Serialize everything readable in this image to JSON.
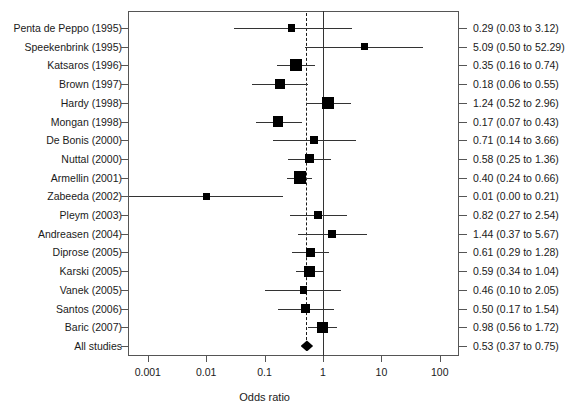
{
  "chart_data": {
    "type": "forest",
    "title": "",
    "xlabel": "Odds ratio",
    "ylabel": "",
    "xscale": "log",
    "xlim": [
      0.001,
      100
    ],
    "xticks": [
      0.001,
      0.01,
      0.1,
      1,
      10,
      100
    ],
    "xticklabels": [
      "0.001",
      "0.01",
      "0.1",
      "1",
      "10",
      "100"
    ],
    "null_line": 1,
    "pooled_line": 0.53,
    "grid": false,
    "legend": "none",
    "columns": [
      "Study",
      "Odds ratio (95% CI)"
    ],
    "rows": [
      {
        "study": "Penta de Peppo (1995)",
        "or": 0.29,
        "low": 0.03,
        "high": 3.12,
        "result": "0.29 (0.03 to 3.12)",
        "weight": 0.3,
        "marker": "square"
      },
      {
        "study": "Speekenbrink (1995)",
        "or": 5.09,
        "low": 0.5,
        "high": 52.29,
        "result": "5.09 (0.50 to 52.29)",
        "weight": 0.28,
        "marker": "square"
      },
      {
        "study": "Katsaros (1996)",
        "or": 0.35,
        "low": 0.16,
        "high": 0.74,
        "result": "0.35 (0.16 to 0.74)",
        "weight": 0.8,
        "marker": "square"
      },
      {
        "study": "Brown (1997)",
        "or": 0.18,
        "low": 0.06,
        "high": 0.55,
        "result": "0.18 (0.06 to 0.55)",
        "weight": 0.58,
        "marker": "square"
      },
      {
        "study": "Hardy (1998)",
        "or": 1.24,
        "low": 0.52,
        "high": 2.96,
        "result": "1.24 (0.52 to 2.96)",
        "weight": 0.8,
        "marker": "square"
      },
      {
        "study": "Mongan (1998)",
        "or": 0.17,
        "low": 0.07,
        "high": 0.43,
        "result": "0.17 (0.07 to 0.43)",
        "weight": 0.62,
        "marker": "square"
      },
      {
        "study": "De Bonis (2000)",
        "or": 0.71,
        "low": 0.14,
        "high": 3.66,
        "result": "0.71 (0.14 to 3.66)",
        "weight": 0.34,
        "marker": "square"
      },
      {
        "study": "Nuttal (2000)",
        "or": 0.58,
        "low": 0.25,
        "high": 1.36,
        "result": "0.58 (0.25 to 1.36)",
        "weight": 0.48,
        "marker": "square"
      },
      {
        "study": "Armellin (2001)",
        "or": 0.4,
        "low": 0.24,
        "high": 0.66,
        "result": "0.40 (0.24 to 0.66)",
        "weight": 0.82,
        "marker": "square"
      },
      {
        "study": "Zabeeda (2002)",
        "or": 0.01,
        "low": 0.0,
        "high": 0.21,
        "result": "0.01 (0.00 to 0.21)",
        "weight": 0.26,
        "marker": "square"
      },
      {
        "study": "Pleym (2003)",
        "or": 0.82,
        "low": 0.27,
        "high": 2.54,
        "result": "0.82 (0.27 to 2.54)",
        "weight": 0.4,
        "marker": "square"
      },
      {
        "study": "Andreasen (2004)",
        "or": 1.44,
        "low": 0.37,
        "high": 5.67,
        "result": "1.44 (0.37 to 5.67)",
        "weight": 0.38,
        "marker": "square"
      },
      {
        "study": "Diprose (2005)",
        "or": 0.61,
        "low": 0.29,
        "high": 1.28,
        "result": "0.61 (0.29 to 1.28)",
        "weight": 0.54,
        "marker": "square"
      },
      {
        "study": "Karski (2005)",
        "or": 0.59,
        "low": 0.34,
        "high": 1.04,
        "result": "0.59 (0.34 to 1.04)",
        "weight": 0.68,
        "marker": "square"
      },
      {
        "study": "Vanek (2005)",
        "or": 0.46,
        "low": 0.1,
        "high": 2.05,
        "result": "0.46 (0.10 to 2.05)",
        "weight": 0.32,
        "marker": "square"
      },
      {
        "study": "Santos (2006)",
        "or": 0.5,
        "low": 0.17,
        "high": 1.54,
        "result": "0.50 (0.17 to 1.54)",
        "weight": 0.4,
        "marker": "square"
      },
      {
        "study": "Baric (2007)",
        "or": 0.98,
        "low": 0.56,
        "high": 1.72,
        "result": "0.98 (0.56 to 1.72)",
        "weight": 0.66,
        "marker": "square"
      },
      {
        "study": "All studies",
        "or": 0.53,
        "low": 0.37,
        "high": 0.75,
        "result": "0.53 (0.37 to 0.75)",
        "weight": 1.0,
        "marker": "diamond"
      }
    ]
  }
}
